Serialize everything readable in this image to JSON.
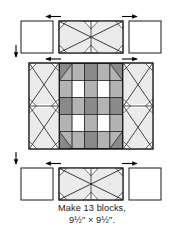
{
  "figure": {
    "kind": "quilt-block-assembly-diagram",
    "caption": {
      "line1": "Make 13 blocks,",
      "line2": "9½\" × 9½\"."
    }
  },
  "colors": {
    "outline": "#1a1a1a",
    "background": "#ffffff",
    "light_gray": "#ebebeb",
    "medium_gray": "#b3b3b3",
    "dark_gray": "#8a8a8a",
    "white_patch": "#ffffff",
    "arrow": "#000000"
  },
  "arrows": {
    "top_left": "arrow-left",
    "top_right": "arrow-right",
    "mid_left": "arrow-left",
    "mid_right": "arrow-right",
    "bottom_left": "arrow-left",
    "bottom_right": "arrow-right",
    "side_upper": "arrow-down",
    "side_lower": "arrow-down"
  },
  "rows": [
    {
      "name": "top-row",
      "units": [
        {
          "name": "plain-square-left",
          "type": "plain"
        },
        {
          "name": "snowball-pair-top",
          "type": "snowball-pair"
        },
        {
          "name": "plain-square-right",
          "type": "plain"
        }
      ]
    },
    {
      "name": "middle-row",
      "units": [
        {
          "name": "snowball-column-left",
          "type": "snowball-column"
        },
        {
          "name": "nine-patch-center",
          "type": "checker-center"
        },
        {
          "name": "snowball-column-right",
          "type": "snowball-column"
        }
      ]
    },
    {
      "name": "bottom-row",
      "units": [
        {
          "name": "plain-square-left",
          "type": "plain"
        },
        {
          "name": "snowball-pair-bottom",
          "type": "snowball-pair"
        },
        {
          "name": "plain-square-right",
          "type": "plain"
        }
      ]
    }
  ],
  "center_grid": {
    "rows": 5,
    "cols": 5,
    "cells": [
      [
        "medium",
        "medium",
        "dark",
        "medium",
        "medium"
      ],
      [
        "medium",
        "white",
        "medium",
        "white",
        "medium"
      ],
      [
        "dark",
        "medium",
        "dark",
        "medium",
        "dark"
      ],
      [
        "medium",
        "white",
        "medium",
        "white",
        "medium"
      ],
      [
        "medium",
        "medium",
        "dark",
        "medium",
        "medium"
      ]
    ],
    "corner_triangles": "dark"
  }
}
